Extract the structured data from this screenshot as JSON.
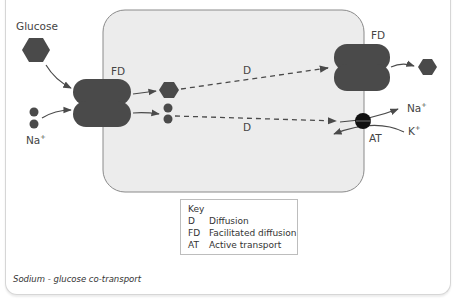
{
  "diagram": {
    "title": "Sodium - glucose co-transport",
    "colors": {
      "molecule": "#4a4a4a",
      "cell_fill": "#ececec",
      "cell_border": "#888888",
      "pump": "#111111",
      "arrow": "#4a4a4a"
    },
    "labels": {
      "glucose": "Glucose",
      "na_left": "Na",
      "na_left_sup": "+",
      "fd_left": "FD",
      "fd_right": "FD",
      "d_top": "D",
      "d_bottom": "D",
      "na_right": "Na",
      "na_right_sup": "+",
      "k_right": "K",
      "k_right_sup": "+",
      "at": "AT"
    },
    "key": {
      "heading": "Key",
      "items": [
        {
          "abbr": "D",
          "meaning": "Diffusion"
        },
        {
          "abbr": "FD",
          "meaning": "Facilitated diffusion"
        },
        {
          "abbr": "AT",
          "meaning": "Active transport"
        }
      ]
    },
    "nodes": [
      {
        "id": "glucose-outside-left",
        "shape": "hexagon"
      },
      {
        "id": "sodium-outside-left",
        "shape": "two-circles"
      },
      {
        "id": "fd-carrier-left",
        "shape": "double-lobed-protein"
      },
      {
        "id": "glucose-inside",
        "shape": "hexagon"
      },
      {
        "id": "sodium-inside",
        "shape": "two-circles"
      },
      {
        "id": "fd-carrier-right",
        "shape": "double-lobed-protein"
      },
      {
        "id": "glucose-outside-right",
        "shape": "hexagon"
      },
      {
        "id": "na-k-pump",
        "shape": "black-circle"
      }
    ],
    "edges": [
      {
        "from": "glucose-outside-left",
        "to": "fd-carrier-left",
        "style": "solid"
      },
      {
        "from": "sodium-outside-left",
        "to": "fd-carrier-left",
        "style": "solid"
      },
      {
        "from": "fd-carrier-left",
        "to": "glucose-inside",
        "style": "solid"
      },
      {
        "from": "fd-carrier-left",
        "to": "sodium-inside",
        "style": "solid"
      },
      {
        "from": "glucose-inside",
        "to": "fd-carrier-right",
        "style": "dashed",
        "label": "D"
      },
      {
        "from": "sodium-inside",
        "to": "na-k-pump",
        "style": "dashed",
        "label": "D"
      },
      {
        "from": "fd-carrier-right",
        "to": "glucose-outside-right",
        "style": "solid"
      },
      {
        "from": "na-k-pump",
        "to": "Na+ outside",
        "style": "solid"
      },
      {
        "from": "K+ outside",
        "to": "inside",
        "style": "solid",
        "via": "na-k-pump"
      }
    ]
  }
}
